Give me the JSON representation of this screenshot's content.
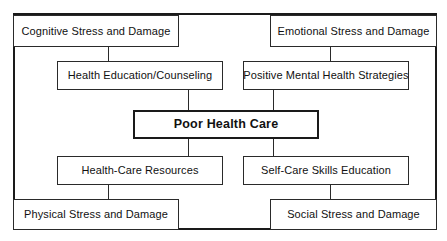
{
  "diagram": {
    "type": "flow-diagram",
    "center_node": {
      "id": "poor-health-care",
      "label": "Poor Health Care",
      "emphasis": true
    },
    "nodes": [
      {
        "id": "cognitive-stress-and-damage",
        "label": "Cognitive Stress and Damage",
        "row": "outer-top",
        "column": "left"
      },
      {
        "id": "emotional-stress-and-damage",
        "label": "Emotional Stress and Damage",
        "row": "outer-top",
        "column": "right"
      },
      {
        "id": "health-education-counseling",
        "label": "Health Education/Counseling",
        "row": "inner-top",
        "column": "left"
      },
      {
        "id": "positive-mental-health-strategies",
        "label": "Positive Mental Health Strategies",
        "row": "inner-top",
        "column": "right"
      },
      {
        "id": "health-care-resources",
        "label": "Health-Care Resources",
        "row": "inner-bottom",
        "column": "left"
      },
      {
        "id": "self-care-skills-education",
        "label": "Self-Care Skills Education",
        "row": "inner-bottom",
        "column": "right"
      },
      {
        "id": "physical-stress-and-damage",
        "label": "Physical Stress and Damage",
        "row": "outer-bottom",
        "column": "left"
      },
      {
        "id": "social-stress-and-damage",
        "label": "Social Stress and Damage",
        "row": "outer-bottom",
        "column": "right"
      }
    ],
    "connections": [
      {
        "from": "cognitive-stress-and-damage",
        "to": "health-education-counseling"
      },
      {
        "from": "emotional-stress-and-damage",
        "to": "positive-mental-health-strategies"
      },
      {
        "from": "health-education-counseling",
        "to": "poor-health-care"
      },
      {
        "from": "positive-mental-health-strategies",
        "to": "poor-health-care"
      },
      {
        "from": "poor-health-care",
        "to": "health-care-resources"
      },
      {
        "from": "poor-health-care",
        "to": "self-care-skills-education"
      },
      {
        "from": "health-care-resources",
        "to": "physical-stress-and-damage"
      },
      {
        "from": "self-care-skills-education",
        "to": "social-stress-and-damage"
      }
    ],
    "colors": {
      "frame_stroke": "#1a1a1a",
      "node_stroke": "#2a2a2a",
      "node_fill": "#ffffff",
      "text": "#111111",
      "background": "#ffffff"
    }
  }
}
